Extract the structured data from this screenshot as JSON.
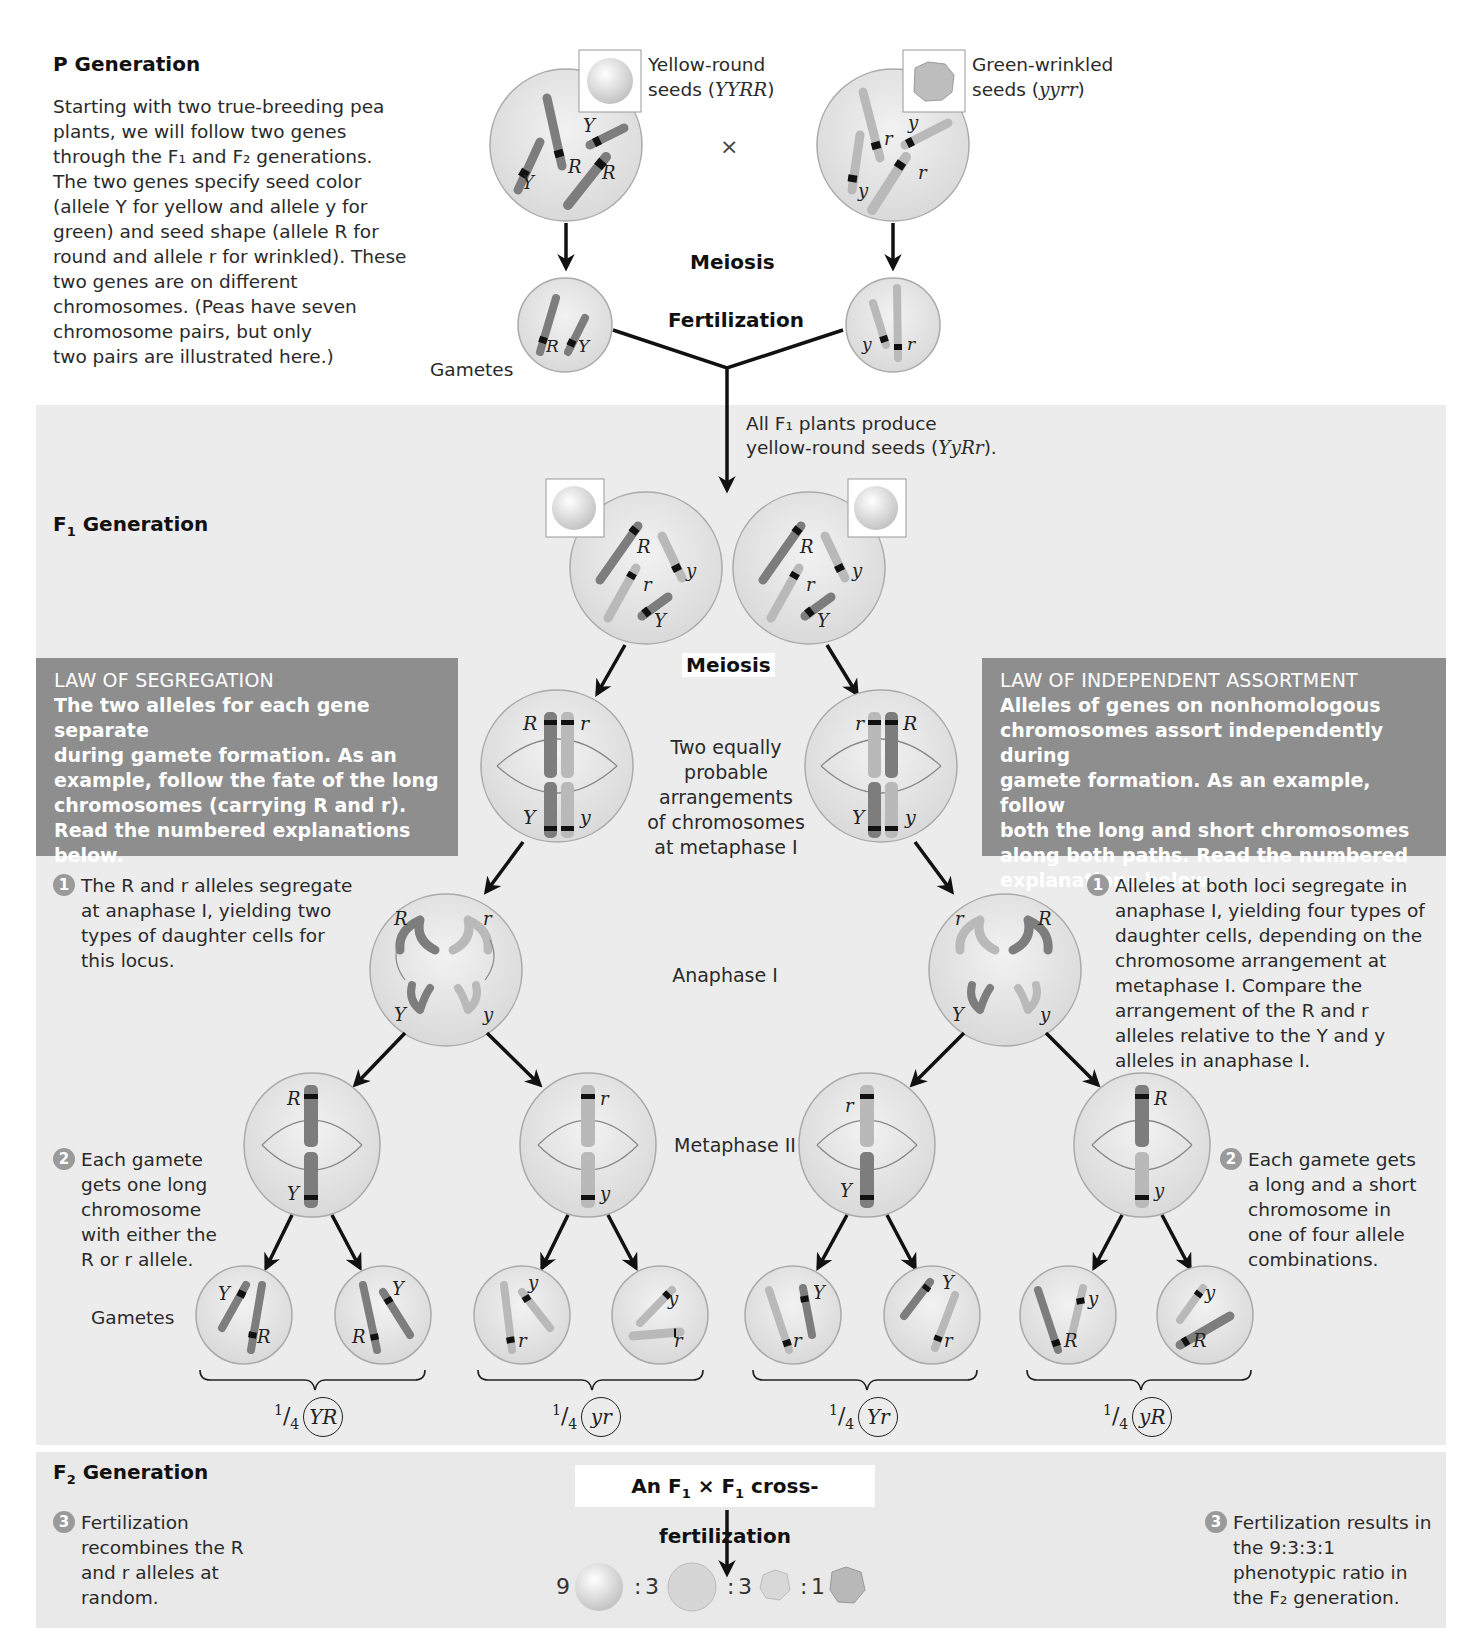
{
  "figure": {
    "p_generation": {
      "heading": "P Generation",
      "intro_lines": [
        "Starting with two true-breeding pea",
        "plants, we will follow two genes",
        "through the F₁ and F₂ generations.",
        "The two genes specify seed color",
        "(allele Y for yellow and allele y for",
        "green) and seed shape (allele R for",
        "round and allele r for wrinkled). These",
        "two genes are on different",
        "chromosomes. (Peas have seven",
        "chromosome pairs, but only",
        "two pairs are illustrated here.)"
      ],
      "parent_left": {
        "label_line1": "Yellow-round",
        "label_line2": "seeds (",
        "genotype": "YYRR",
        "label_close": ")",
        "alleles": [
          "Y",
          "Y",
          "R",
          "R"
        ]
      },
      "parent_right": {
        "label_line1": "Green-wrinkled",
        "label_line2": "seeds (",
        "genotype": "yyrr",
        "label_close": ")",
        "alleles": [
          "y",
          "y",
          "r",
          "r"
        ]
      },
      "cross_symbol": "×",
      "meiosis_label": "Meiosis",
      "fertilization_label": "Fertilization",
      "gametes_label": "Gametes",
      "gamete_left_alleles": [
        "R",
        "Y"
      ],
      "gamete_right_alleles": [
        "y",
        "r"
      ]
    },
    "f1_note": {
      "line1": "All F₁ plants produce",
      "line2_prefix": "yellow-round seeds (",
      "genotype": "YyRr",
      "line2_suffix": ")."
    },
    "f1_generation": {
      "heading_prefix": "F",
      "heading_sub": "1",
      "heading_suffix": " Generation",
      "cell_alleles": [
        "R",
        "r",
        "y",
        "Y"
      ],
      "meiosis_label": "Meiosis",
      "metaphase_I_note": [
        "Two equally",
        "probable",
        "arrangements",
        "of chromosomes",
        "at metaphase I"
      ],
      "anaphase_I_label": "Anaphase I",
      "metaphase_II_label": "Metaphase II",
      "gametes_label": "Gametes"
    },
    "law_segregation": {
      "title": "LAW OF SEGREGATION",
      "description_lines": [
        "The two alleles for each gene separate",
        "during gamete formation. As an",
        "example, follow the fate of the long",
        "chromosomes (carrying R and r).",
        "Read the numbered explanations",
        "below."
      ]
    },
    "law_independent_assortment": {
      "title": "LAW OF INDEPENDENT ASSORTMENT",
      "description_lines": [
        "Alleles of genes on nonhomologous",
        "chromosomes assort independently during",
        "gamete formation. As an example, follow",
        "both the long and short chromosomes",
        "along both paths. Read the numbered",
        "explanations below."
      ]
    },
    "steps_left": [
      {
        "number": "1",
        "lines": [
          "The R and r alleles segregate",
          "at anaphase I, yielding two",
          "types of daughter cells for",
          "this locus."
        ]
      },
      {
        "number": "2",
        "lines": [
          "Each gamete",
          "gets one long",
          "chromosome",
          "with either the",
          "R or r allele."
        ]
      },
      {
        "number": "3",
        "lines": [
          "Fertilization",
          "recombines the R",
          "and r alleles at",
          "random."
        ]
      }
    ],
    "steps_right": [
      {
        "number": "1",
        "lines": [
          "Alleles at both loci segregate in",
          "anaphase I, yielding four types of",
          "daughter cells, depending on the",
          "chromosome arrangement at",
          "metaphase I. Compare the",
          "arrangement of the R and r",
          "alleles relative to the Y and y",
          "alleles in anaphase I."
        ]
      },
      {
        "number": "2",
        "lines": [
          "Each gamete gets",
          "a long and a short",
          "chromosome in",
          "one of four allele",
          "combinations."
        ]
      },
      {
        "number": "3",
        "lines": [
          "Fertilization results in",
          "the 9:3:3:1",
          "phenotypic ratio in",
          "the F₂ generation."
        ]
      }
    ],
    "metaphase_I_left": {
      "top": [
        "R",
        "r"
      ],
      "bottom": [
        "Y",
        "y"
      ]
    },
    "metaphase_I_right": {
      "top": [
        "r",
        "R"
      ],
      "bottom": [
        "Y",
        "y"
      ]
    },
    "anaphase_I_left": {
      "top": [
        "R",
        "r"
      ],
      "bottom": [
        "Y",
        "y"
      ]
    },
    "anaphase_I_right": {
      "top": [
        "r",
        "R"
      ],
      "bottom": [
        "Y",
        "y"
      ]
    },
    "metaphase_II": [
      {
        "top": "R",
        "bottom": "Y"
      },
      {
        "top": "r",
        "bottom": "y"
      },
      {
        "top": "r",
        "bottom": "Y"
      },
      {
        "top": "R",
        "bottom": "y"
      }
    ],
    "gamete_groups": [
      {
        "fraction_num": "1",
        "fraction_den": "4",
        "genotype": "YR",
        "gametes": [
          [
            "Y",
            "R"
          ],
          [
            "R",
            "Y"
          ]
        ]
      },
      {
        "fraction_num": "1",
        "fraction_den": "4",
        "genotype": "yr",
        "gametes": [
          [
            "r",
            "y"
          ],
          [
            "y",
            "r"
          ]
        ]
      },
      {
        "fraction_num": "1",
        "fraction_den": "4",
        "genotype": "Yr",
        "gametes": [
          [
            "r",
            "Y"
          ],
          [
            "Y",
            "r"
          ]
        ]
      },
      {
        "fraction_num": "1",
        "fraction_den": "4",
        "genotype": "yR",
        "gametes": [
          [
            "y",
            "R"
          ],
          [
            "y",
            "R"
          ]
        ]
      }
    ],
    "f2_generation": {
      "heading_prefix": "F",
      "heading_sub": "2",
      "heading_suffix": " Generation",
      "cross_label_prefix": "An F",
      "cross_label_sub1": "1",
      "cross_label_mid": " × F",
      "cross_label_sub2": "1",
      "cross_label_suffix": " cross-fertilization",
      "ratio": [
        {
          "count": "9",
          "phenotype": "yellow-round"
        },
        {
          "count": "3",
          "phenotype": "green-round"
        },
        {
          "count": "3",
          "phenotype": "yellow-wrinkled"
        },
        {
          "count": "1",
          "phenotype": "green-wrinkled"
        }
      ],
      "ratio_sep": ":"
    },
    "colors": {
      "band_bg": "#ececec",
      "law_box_bg": "#8e8e8e",
      "badge_bg": "#9a9a9a",
      "cell_fill": "#e6e6e6",
      "chrom_dark": "#7d7d7d",
      "chrom_light": "#b9b9b9",
      "arrow": "#111111"
    }
  }
}
